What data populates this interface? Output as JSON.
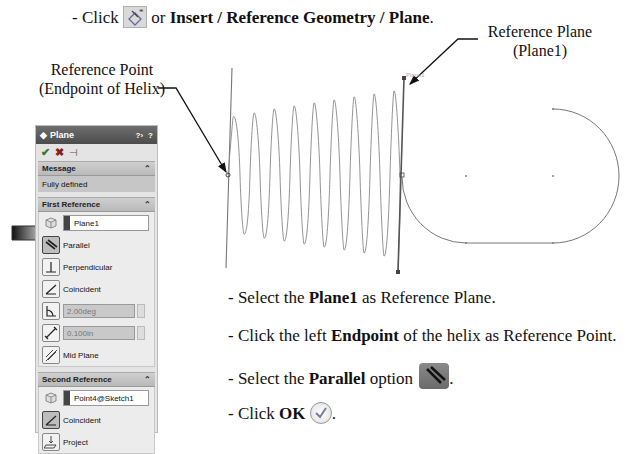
{
  "instruction_top": {
    "prefix": "- Click ",
    "connector": " or ",
    "menu_path": "Insert / Reference Geometry / Plane",
    "suffix": ".",
    "icon": "reference-plane-icon"
  },
  "callouts": {
    "reference_point": {
      "line1": "Reference Point",
      "line2": "(Endpoint of Helix)"
    },
    "reference_plane": {
      "line1": "Reference Plane",
      "line2": "(Plane1)"
    }
  },
  "graphics": {
    "plane_label": "Plane1",
    "helix_turns": 10
  },
  "property_manager": {
    "title": "Plane",
    "title_icon": "plane-icon",
    "header_buttons": [
      "help-icon",
      "question-icon"
    ],
    "toolbar": [
      "ok-check-icon",
      "cancel-x-icon",
      "pushpin-icon"
    ],
    "message": {
      "header": "Message",
      "text": "Fully defined"
    },
    "first_reference": {
      "header": "First Reference",
      "selection": "Plane1",
      "options": [
        {
          "label": "Parallel",
          "icon": "parallel-icon",
          "selected": true
        },
        {
          "label": "Perpendicular",
          "icon": "perpendicular-icon",
          "selected": false
        },
        {
          "label": "Coincident",
          "icon": "coincident-icon",
          "selected": false
        }
      ],
      "angle_value": "2.00deg",
      "distance_value": "0.100in",
      "mid_plane_label": "Mid Plane"
    },
    "second_reference": {
      "header": "Second Reference",
      "selection": "Point4@Sketch1",
      "options": [
        {
          "label": "Coincident",
          "icon": "coincident-icon",
          "selected": true
        },
        {
          "label": "Project",
          "icon": "project-icon",
          "selected": false
        }
      ]
    }
  },
  "steps": [
    {
      "pre": "- Select the ",
      "bold": "Plane1",
      "post": " as Reference Plane."
    },
    {
      "pre": "- Click the left ",
      "bold": "Endpoint",
      "post": " of the helix as Reference Point."
    },
    {
      "pre": "- Select the ",
      "bold": "Parallel",
      "post": " option",
      "end": "."
    },
    {
      "pre": "- Click ",
      "bold": "OK",
      "post": "",
      "end": "."
    }
  ]
}
